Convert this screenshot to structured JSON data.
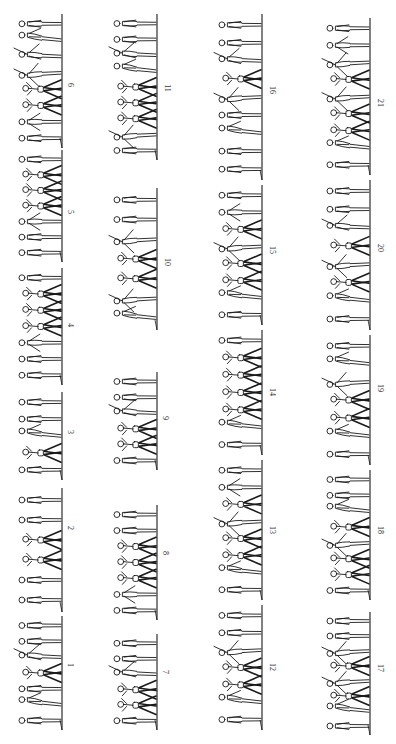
{
  "figure": {
    "ink_color": "#1a1a1a",
    "paper_color": "#ffffff",
    "columns": [
      {
        "ground_x": 62,
        "label_x": 70,
        "panels": [
          {
            "number": "6",
            "y_start": 14,
            "y_end": 148,
            "label_y": 85,
            "figures": [
              "stand",
              "lean",
              "reach",
              "spread",
              "pyramid-base",
              "pyramid-base",
              "raise",
              "stand"
            ]
          },
          {
            "number": "5",
            "y_start": 150,
            "y_end": 262,
            "label_y": 212,
            "figures": [
              "stand",
              "pyramid-base",
              "pyramid-base",
              "pyramid-base",
              "raise",
              "stand",
              "stand"
            ]
          },
          {
            "number": "4",
            "y_start": 268,
            "y_end": 385,
            "label_y": 325,
            "figures": [
              "stand",
              "pyramid-base",
              "pyramid-base",
              "pyramid-base",
              "raise",
              "stand",
              "stand"
            ]
          },
          {
            "number": "3",
            "y_start": 392,
            "y_end": 480,
            "label_y": 432,
            "figures": [
              "stand",
              "stand",
              "lean",
              "pyramid-base",
              "stand"
            ]
          },
          {
            "number": "2",
            "y_start": 488,
            "y_end": 612,
            "label_y": 528,
            "figures": [
              "stand",
              "stand",
              "pyramid-base",
              "pyramid-base",
              "stand",
              "stand"
            ]
          },
          {
            "number": "1",
            "y_start": 616,
            "y_end": 730,
            "label_y": 665,
            "figures": [
              "stand",
              "stand",
              "reach",
              "pyramid-base",
              "stand",
              "lean",
              "stand"
            ]
          }
        ]
      },
      {
        "ground_x": 157,
        "label_x": 165,
        "panels": [
          {
            "number": "11",
            "y_start": 14,
            "y_end": 160,
            "label_y": 88,
            "figures": [
              "stand",
              "stand",
              "reach",
              "lean",
              "pyramid-base",
              "pyramid-base",
              "pyramid-base",
              "spread",
              "stand"
            ]
          },
          {
            "number": "10",
            "y_start": 188,
            "y_end": 330,
            "label_y": 262,
            "figures": [
              "stand",
              "stand",
              "spread",
              "pyramid-base",
              "pyramid-base",
              "spread",
              "lean"
            ]
          },
          {
            "number": "9",
            "y_start": 372,
            "y_end": 470,
            "label_y": 418,
            "figures": [
              "stand",
              "stand",
              "reach",
              "pyramid-base",
              "pyramid-base",
              "stand"
            ]
          },
          {
            "number": "8",
            "y_start": 505,
            "y_end": 620,
            "label_y": 553,
            "figures": [
              "stand",
              "stand",
              "pyramid-base",
              "pyramid-base",
              "pyramid-base",
              "raise",
              "stand"
            ]
          },
          {
            "number": "7",
            "y_start": 634,
            "y_end": 730,
            "label_y": 672,
            "figures": [
              "stand",
              "stand",
              "reach",
              "pyramid-base",
              "pyramid-base",
              "stand"
            ]
          }
        ]
      },
      {
        "ground_x": 262,
        "label_x": 270,
        "panels": [
          {
            "number": "16",
            "y_start": 14,
            "y_end": 180,
            "label_y": 90,
            "figures": [
              "stand",
              "stand",
              "reach",
              "pyramid-base",
              "spread",
              "stand",
              "lean",
              "stand",
              "stand"
            ]
          },
          {
            "number": "15",
            "y_start": 185,
            "y_end": 325,
            "label_y": 250,
            "figures": [
              "stand",
              "raise",
              "pyramid-base",
              "spread",
              "pyramid-base",
              "pyramid-base",
              "lean",
              "stand"
            ]
          },
          {
            "number": "14",
            "y_start": 330,
            "y_end": 455,
            "label_y": 392,
            "figures": [
              "stand",
              "pyramid-base",
              "pyramid-base",
              "pyramid-base",
              "pyramid-base",
              "lean",
              "stand"
            ]
          },
          {
            "number": "13",
            "y_start": 460,
            "y_end": 600,
            "label_y": 530,
            "figures": [
              "stand",
              "raise",
              "pyramid-base",
              "spread",
              "pyramid-base",
              "pyramid-base",
              "lean",
              "stand"
            ]
          },
          {
            "number": "12",
            "y_start": 605,
            "y_end": 730,
            "label_y": 667,
            "figures": [
              "stand",
              "stand",
              "spread",
              "pyramid-base",
              "pyramid-base",
              "lean",
              "stand"
            ]
          }
        ]
      },
      {
        "ground_x": 370,
        "label_x": 378,
        "panels": [
          {
            "number": "21",
            "y_start": 18,
            "y_end": 175,
            "label_y": 103,
            "figures": [
              "stand",
              "raise",
              "spread",
              "pyramid-base",
              "spread",
              "pyramid-base",
              "pyramid-base",
              "lean",
              "stand"
            ]
          },
          {
            "number": "20",
            "y_start": 180,
            "y_end": 330,
            "label_y": 248,
            "figures": [
              "stand",
              "stand",
              "reach",
              "pyramid-base",
              "spread",
              "pyramid-base",
              "lean",
              "stand"
            ]
          },
          {
            "number": "19",
            "y_start": 335,
            "y_end": 465,
            "label_y": 388,
            "figures": [
              "stand",
              "lean",
              "spread",
              "pyramid-base",
              "pyramid-base",
              "lean",
              "stand"
            ]
          },
          {
            "number": "18",
            "y_start": 470,
            "y_end": 600,
            "label_y": 530,
            "figures": [
              "stand",
              "stand",
              "lean",
              "pyramid-base",
              "spread",
              "pyramid-base",
              "pyramid-base",
              "stand"
            ]
          },
          {
            "number": "17",
            "y_start": 612,
            "y_end": 735,
            "label_y": 668,
            "figures": [
              "stand",
              "stand",
              "spread",
              "pyramid-base",
              "spread",
              "pyramid-base",
              "lean",
              "stand"
            ]
          }
        ]
      }
    ]
  }
}
